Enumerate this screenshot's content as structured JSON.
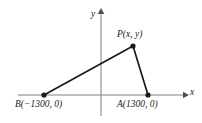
{
  "figure": {
    "type": "coordinate-geometry-diagram",
    "background_color": "#ffffff",
    "line_color": "#1a1a1a",
    "axis_color": "#808080"
  },
  "axes": {
    "x_label": "x",
    "y_label": "y",
    "x_axis": {
      "x1": 18,
      "y1": 95,
      "x2": 187,
      "y2": 95,
      "arrow": "right"
    },
    "y_axis": {
      "x1": 101,
      "y1": 10,
      "x2": 101,
      "y2": 116,
      "arrow": "up"
    }
  },
  "points": [
    {
      "id": "P",
      "label": "P(x, y)",
      "px": 133,
      "py": 46,
      "marker": "filled-dot"
    },
    {
      "id": "A",
      "label": "A(1300, 0)",
      "px": 148,
      "py": 95,
      "marker": "filled-dot"
    },
    {
      "id": "B",
      "label": "B(−1300, 0)",
      "px": 44,
      "py": 95,
      "marker": "filled-dot"
    }
  ],
  "segments": [
    {
      "id": "BP",
      "from": "B",
      "to": "P"
    },
    {
      "id": "PA",
      "from": "P",
      "to": "A"
    }
  ]
}
